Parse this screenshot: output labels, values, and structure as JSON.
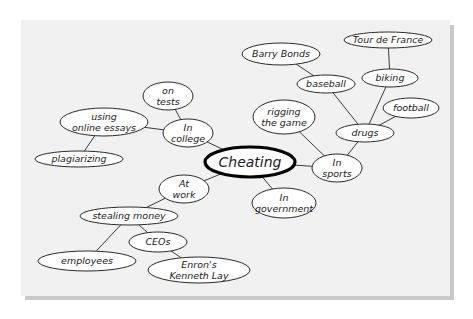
{
  "diagram": {
    "type": "mind-map",
    "colors": {
      "background": "#ffffff",
      "panel": "#f1f1f1",
      "panel_shadow": "#c9c9c9",
      "node_fill": "#ffffff",
      "node_stroke": "#2a2a2a",
      "edge": "#3a3a3a"
    },
    "central": {
      "id": "cheating",
      "label": "Cheating",
      "cx": 250,
      "cy": 162,
      "rx": 45,
      "ry": 15
    },
    "nodes": [
      {
        "id": "in-college",
        "lines": [
          "In",
          "college"
        ],
        "cx": 188,
        "cy": 133,
        "rx": 25,
        "ry": 14
      },
      {
        "id": "on-tests",
        "lines": [
          "on",
          "tests"
        ],
        "cx": 168,
        "cy": 96,
        "rx": 25,
        "ry": 14
      },
      {
        "id": "using-online-essays",
        "lines": [
          "using",
          "online essays"
        ],
        "cx": 104,
        "cy": 122,
        "rx": 44,
        "ry": 14
      },
      {
        "id": "plagiarizing",
        "lines": [
          "plagiarizing"
        ],
        "cx": 79,
        "cy": 159,
        "rx": 44,
        "ry": 8
      },
      {
        "id": "at-work",
        "lines": [
          "At",
          "work"
        ],
        "cx": 184,
        "cy": 189,
        "rx": 25,
        "ry": 14
      },
      {
        "id": "stealing-money",
        "lines": [
          "stealing money"
        ],
        "cx": 129,
        "cy": 216,
        "rx": 49,
        "ry": 9
      },
      {
        "id": "employees",
        "lines": [
          "employees"
        ],
        "cx": 87,
        "cy": 261,
        "rx": 49,
        "ry": 10
      },
      {
        "id": "ceos",
        "lines": [
          "CEOs"
        ],
        "cx": 158,
        "cy": 242,
        "rx": 29,
        "ry": 10
      },
      {
        "id": "enrons-kenneth-lay",
        "lines": [
          "Enron's",
          "Kenneth Lay"
        ],
        "cx": 199,
        "cy": 270,
        "rx": 51,
        "ry": 13
      },
      {
        "id": "in-government",
        "lines": [
          "In",
          "government"
        ],
        "cx": 284,
        "cy": 203,
        "rx": 32,
        "ry": 15
      },
      {
        "id": "in-sports",
        "lines": [
          "In",
          "sports"
        ],
        "cx": 337,
        "cy": 168,
        "rx": 25,
        "ry": 14
      },
      {
        "id": "rigging-the-game",
        "lines": [
          "rigging",
          "the game"
        ],
        "cx": 284,
        "cy": 117,
        "rx": 31,
        "ry": 17
      },
      {
        "id": "drugs",
        "lines": [
          "drugs"
        ],
        "cx": 365,
        "cy": 133,
        "rx": 29,
        "ry": 9
      },
      {
        "id": "baseball",
        "lines": [
          "baseball"
        ],
        "cx": 326,
        "cy": 84,
        "rx": 29,
        "ry": 9
      },
      {
        "id": "barry-bonds",
        "lines": [
          "Barry Bonds"
        ],
        "cx": 281,
        "cy": 54,
        "rx": 39,
        "ry": 11
      },
      {
        "id": "biking",
        "lines": [
          "biking"
        ],
        "cx": 390,
        "cy": 78,
        "rx": 28,
        "ry": 9
      },
      {
        "id": "tour-de-france",
        "lines": [
          "Tour de France"
        ],
        "cx": 388,
        "cy": 40,
        "rx": 44,
        "ry": 8
      },
      {
        "id": "football",
        "lines": [
          "football"
        ],
        "cx": 411,
        "cy": 108,
        "rx": 28,
        "ry": 10
      }
    ],
    "edges": [
      [
        "cheating",
        "in-college"
      ],
      [
        "in-college",
        "on-tests"
      ],
      [
        "in-college",
        "using-online-essays"
      ],
      [
        "using-online-essays",
        "plagiarizing"
      ],
      [
        "cheating",
        "at-work"
      ],
      [
        "at-work",
        "stealing-money"
      ],
      [
        "stealing-money",
        "employees"
      ],
      [
        "stealing-money",
        "ceos"
      ],
      [
        "ceos",
        "enrons-kenneth-lay"
      ],
      [
        "cheating",
        "in-government"
      ],
      [
        "cheating",
        "in-sports"
      ],
      [
        "in-sports",
        "rigging-the-game"
      ],
      [
        "in-sports",
        "drugs"
      ],
      [
        "drugs",
        "baseball"
      ],
      [
        "baseball",
        "barry-bonds"
      ],
      [
        "drugs",
        "biking"
      ],
      [
        "biking",
        "tour-de-france"
      ],
      [
        "drugs",
        "football"
      ]
    ]
  }
}
